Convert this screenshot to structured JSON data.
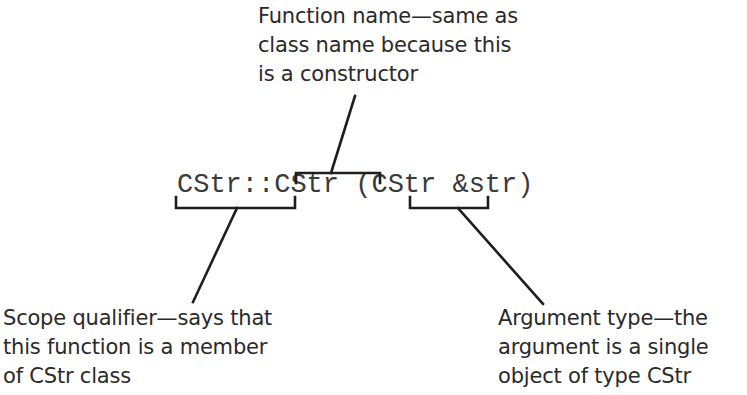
{
  "annotations": {
    "function_name": {
      "lines": [
        "Function name—same as",
        "class name because this",
        "is a constructor"
      ]
    },
    "scope_qualifier": {
      "lines": [
        "Scope qualifier—says that",
        "this function is a member",
        "of CStr class"
      ]
    },
    "argument_type": {
      "lines": [
        "Argument type—the",
        "argument is a single",
        "object of type CStr"
      ]
    }
  },
  "code": {
    "scope": "CStr::",
    "function": "CStr",
    "space": " ",
    "open_paren": "(",
    "arg_type": "CStr",
    "arg_rest": " &str)"
  },
  "colors": {
    "line": "#1e1e1e",
    "text": "#2a2a2a"
  }
}
